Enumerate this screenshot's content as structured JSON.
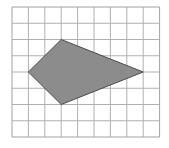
{
  "grid": {
    "columns": 9,
    "rows": 8,
    "left": 12,
    "top": 7,
    "cell_width": 16.4,
    "cell_height": 16.25,
    "line_color": "#b0b0b0",
    "border_color": "#a0a0a0"
  },
  "shape": {
    "type": "kite-quadrilateral",
    "vertices_grid": [
      [
        3,
        2
      ],
      [
        8,
        4
      ],
      [
        3,
        6
      ],
      [
        1,
        4
      ]
    ],
    "fill": "#8c8c8c",
    "stroke": "#4a4a4a"
  }
}
